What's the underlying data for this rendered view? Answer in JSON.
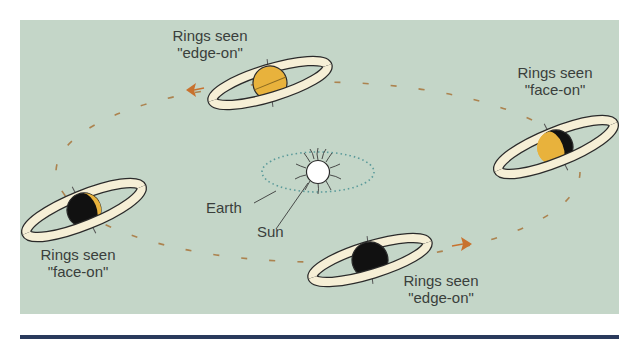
{
  "figure": {
    "colors": {
      "background": "#c4d6c8",
      "orbit_dash": "#a8743a",
      "arrow": "#c8722e",
      "planet_lit": "#e8b23c",
      "planet_dark": "#111111",
      "ring_fill": "#f6efd6",
      "outline": "#2a2a2a",
      "sun": "#ffffff",
      "earth_orbit": "#5a9a9a",
      "bottom_rule": "#2a3a5c",
      "text": "#3a3f3c"
    }
  },
  "labels": {
    "top_left": {
      "line1": "Rings seen",
      "line2": "\"edge-on\""
    },
    "top_right": {
      "line1": "Rings seen",
      "line2": "\"face-on\""
    },
    "bottom_left": {
      "line1": "Rings seen",
      "line2": "\"face-on\""
    },
    "bottom_right": {
      "line1": "Rings seen",
      "line2": "\"edge-on\""
    },
    "earth": "Earth",
    "sun": "Sun"
  },
  "positions": [
    {
      "id": "top",
      "view": "edge-on",
      "lit": "full"
    },
    {
      "id": "right",
      "view": "face-on",
      "lit": "half-left"
    },
    {
      "id": "left",
      "view": "face-on",
      "lit": "crescent-right"
    },
    {
      "id": "bottom",
      "view": "edge-on",
      "lit": "dark"
    }
  ]
}
